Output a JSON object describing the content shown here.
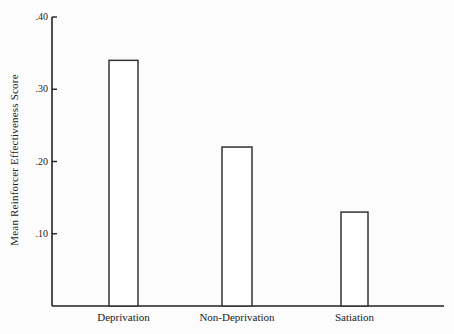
{
  "chart_data": {
    "type": "bar",
    "title": "",
    "xlabel": "",
    "ylabel": "Mean Reinforcer Effectiveness Score",
    "categories": [
      "Deprivation",
      "Non-Deprivation",
      "Satiation"
    ],
    "values": [
      0.34,
      0.22,
      0.13
    ],
    "yticks": [
      ".10",
      ".20",
      ".30",
      ".40"
    ],
    "ytick_values": [
      0.1,
      0.2,
      0.3,
      0.4
    ],
    "ylim": [
      0,
      0.4
    ],
    "grid": false,
    "legend": null,
    "bar_fill": "#ffffff",
    "bar_stroke": "#333333"
  }
}
